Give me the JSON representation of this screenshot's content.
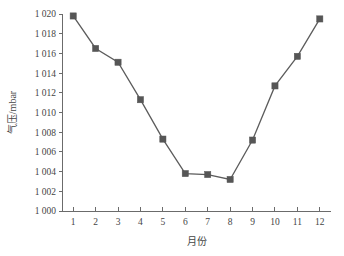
{
  "chart_data": {
    "type": "line",
    "title": "",
    "xlabel": "月份",
    "ylabel": "气压/mbar",
    "x": [
      1,
      2,
      3,
      4,
      5,
      6,
      7,
      8,
      9,
      10,
      11,
      12
    ],
    "values": [
      1019.8,
      1016.5,
      1015.1,
      1011.3,
      1007.3,
      1003.8,
      1003.7,
      1003.2,
      1007.2,
      1012.7,
      1015.7,
      1019.5
    ],
    "series": [
      {
        "name": "气压",
        "values": [
          1019.8,
          1016.5,
          1015.1,
          1011.3,
          1007.3,
          1003.8,
          1003.7,
          1003.2,
          1007.2,
          1012.7,
          1015.7,
          1019.5
        ]
      }
    ],
    "x_tick_labels": [
      "1",
      "2",
      "3",
      "4",
      "5",
      "6",
      "7",
      "8",
      "9",
      "10",
      "11",
      "12"
    ],
    "y_tick_values": [
      1000,
      1002,
      1004,
      1006,
      1008,
      1010,
      1012,
      1014,
      1016,
      1018,
      1020
    ],
    "y_tick_labels": [
      "1 000",
      "1 002",
      "1 004",
      "1 006",
      "1 008",
      "1 010",
      "1 012",
      "1 014",
      "1 016",
      "1 018",
      "1 020"
    ],
    "xlim": [
      0.5,
      12.5
    ],
    "ylim": [
      1000,
      1020
    ],
    "grid": false,
    "legend": "none",
    "line_color": "#5c5c5c",
    "marker_color": "#565656",
    "marker_shape": "square",
    "axis_color": "#6b6b6b",
    "background_color": "#ffffff"
  }
}
